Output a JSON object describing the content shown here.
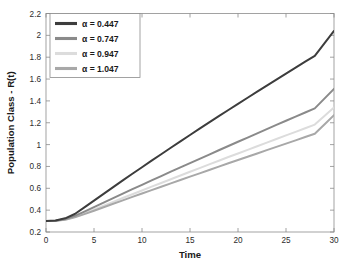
{
  "chart_data": {
    "type": "line",
    "title": "",
    "xlabel": "Time",
    "ylabel": "Population Class - R(t)",
    "xlim": [
      0,
      30
    ],
    "ylim": [
      0.2,
      2.2
    ],
    "xticks": [
      0,
      5,
      10,
      15,
      20,
      25,
      30
    ],
    "yticks": [
      0.2,
      0.4,
      0.6,
      0.8,
      1,
      1.2,
      1.4,
      1.6,
      1.8,
      2,
      2.2
    ],
    "xticklabels": [
      "0",
      "5",
      "10",
      "15",
      "20",
      "25",
      "30"
    ],
    "yticklabels": [
      "0.2",
      "0.4",
      "0.6",
      "0.8",
      "1",
      "1.2",
      "1.4",
      "1.6",
      "1.8",
      "2",
      "2.2"
    ],
    "grid": false,
    "legend_position": "upper left",
    "x": [
      0,
      1,
      2,
      3,
      4,
      5,
      6,
      7,
      8,
      9,
      10,
      11,
      12,
      13,
      14,
      15,
      16,
      17,
      18,
      19,
      20,
      21,
      22,
      23,
      24,
      25,
      26,
      27,
      28,
      29,
      30
    ],
    "series": [
      {
        "name": "α = 0.447",
        "color": "#3d3d3d",
        "values": [
          0.3,
          0.305,
          0.325,
          0.365,
          0.425,
          0.487,
          0.549,
          0.611,
          0.672,
          0.733,
          0.793,
          0.853,
          0.912,
          0.971,
          1.03,
          1.088,
          1.146,
          1.203,
          1.26,
          1.317,
          1.373,
          1.429,
          1.485,
          1.54,
          1.595,
          1.65,
          1.705,
          1.759,
          1.813,
          1.927,
          2.04
        ]
      },
      {
        "name": "α = 0.747",
        "color": "#8a8a8a",
        "values": [
          0.3,
          0.303,
          0.318,
          0.348,
          0.387,
          0.428,
          0.469,
          0.51,
          0.551,
          0.592,
          0.632,
          0.672,
          0.712,
          0.752,
          0.791,
          0.831,
          0.87,
          0.909,
          0.948,
          0.987,
          1.026,
          1.064,
          1.103,
          1.141,
          1.18,
          1.218,
          1.256,
          1.294,
          1.332,
          1.421,
          1.51
        ]
      },
      {
        "name": "α = 0.947",
        "color": "#dcdcdc",
        "values": [
          0.3,
          0.302,
          0.314,
          0.339,
          0.372,
          0.406,
          0.441,
          0.476,
          0.511,
          0.546,
          0.58,
          0.615,
          0.649,
          0.683,
          0.717,
          0.751,
          0.785,
          0.819,
          0.852,
          0.886,
          0.919,
          0.952,
          0.985,
          1.018,
          1.051,
          1.084,
          1.117,
          1.15,
          1.183,
          1.262,
          1.34
        ]
      },
      {
        "name": "α = 1.047",
        "color": "#a8a8a8",
        "values": [
          0.3,
          0.302,
          0.312,
          0.334,
          0.364,
          0.395,
          0.426,
          0.458,
          0.489,
          0.521,
          0.552,
          0.583,
          0.614,
          0.645,
          0.676,
          0.707,
          0.737,
          0.768,
          0.798,
          0.829,
          0.859,
          0.889,
          0.919,
          0.949,
          0.979,
          1.009,
          1.039,
          1.069,
          1.099,
          1.184,
          1.27
        ]
      }
    ]
  }
}
